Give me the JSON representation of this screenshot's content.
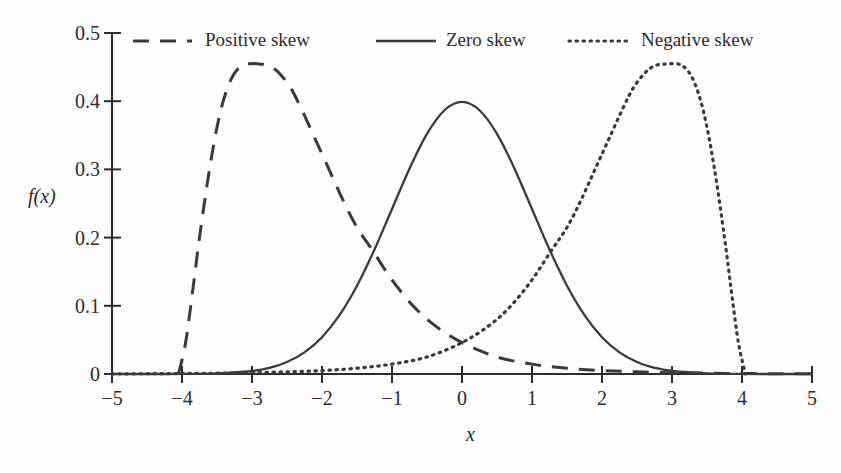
{
  "chart_data": {
    "type": "line",
    "title": "",
    "subtitle": "",
    "xlabel": "x",
    "ylabel": "f(x)",
    "xlim": [
      -5,
      5
    ],
    "ylim": [
      0,
      0.5
    ],
    "grid": false,
    "legend_position": "top-inside",
    "x_ticks": [
      "−5",
      "−4",
      "−3",
      "−2",
      "−1",
      "0",
      "1",
      "2",
      "3",
      "4",
      "5"
    ],
    "x_tick_values": [
      -5,
      -4,
      -3,
      -2,
      -1,
      0,
      1,
      2,
      3,
      4,
      5
    ],
    "y_ticks": [
      "0",
      "0.1",
      "0.2",
      "0.3",
      "0.4",
      "0.5"
    ],
    "y_tick_values": [
      0,
      0.1,
      0.2,
      0.3,
      0.4,
      0.5
    ],
    "line_color": "#3a3a3a",
    "axis_color": "#2b2b2b",
    "series": [
      {
        "name": "Positive skew",
        "style": "dashed",
        "peak_x": -2.8,
        "peak_y": 0.455,
        "x": [
          -4.05,
          -3.95,
          -3.85,
          -3.75,
          -3.6,
          -3.45,
          -3.3,
          -3.15,
          -3.0,
          -2.9,
          -2.8,
          -2.7,
          -2.6,
          -2.45,
          -2.3,
          -2.1,
          -1.9,
          -1.7,
          -1.5,
          -1.27,
          -1.0,
          -0.7,
          -0.4,
          0.0,
          0.5,
          1.0,
          1.5,
          2.0,
          2.5,
          3.0,
          3.5,
          4.0,
          4.5,
          5.0
        ],
        "values": [
          0.0,
          0.045,
          0.12,
          0.2,
          0.305,
          0.385,
          0.432,
          0.452,
          0.455,
          0.4545,
          0.4535,
          0.449,
          0.44,
          0.42,
          0.39,
          0.345,
          0.3,
          0.255,
          0.215,
          0.18,
          0.138,
          0.1,
          0.072,
          0.046,
          0.025,
          0.0145,
          0.0085,
          0.005,
          0.0032,
          0.002,
          0.0012,
          0.0007,
          0.0004,
          0.0002
        ]
      },
      {
        "name": "Zero skew",
        "style": "solid",
        "peak_x": 0.0,
        "peak_y": 0.399,
        "x": [
          -5.0,
          -4.5,
          -4.0,
          -3.5,
          -3.0,
          -2.75,
          -2.5,
          -2.25,
          -2.0,
          -1.75,
          -1.5,
          -1.25,
          -1.0,
          -0.75,
          -0.5,
          -0.25,
          0.0,
          0.25,
          0.5,
          0.75,
          1.0,
          1.25,
          1.5,
          1.75,
          2.0,
          2.25,
          2.5,
          2.75,
          3.0,
          3.5,
          4.0,
          4.5,
          5.0
        ],
        "values": [
          1.5e-06,
          1.6e-05,
          0.00013,
          0.0009,
          0.0044,
          0.0091,
          0.0175,
          0.0317,
          0.054,
          0.0863,
          0.1295,
          0.1826,
          0.242,
          0.3011,
          0.3521,
          0.3867,
          0.3989,
          0.3867,
          0.3521,
          0.3011,
          0.242,
          0.1826,
          0.1295,
          0.0863,
          0.054,
          0.0317,
          0.0175,
          0.0091,
          0.0044,
          0.0009,
          0.00013,
          1.6e-05,
          1.5e-06
        ]
      },
      {
        "name": "Negative skew",
        "style": "dotted",
        "peak_x": 2.8,
        "peak_y": 0.455,
        "x": [
          -5.0,
          -4.5,
          -4.0,
          -3.5,
          -3.0,
          -2.5,
          -2.0,
          -1.5,
          -1.0,
          -0.5,
          0.0,
          0.4,
          0.7,
          1.0,
          1.27,
          1.5,
          1.7,
          1.9,
          2.1,
          2.3,
          2.45,
          2.6,
          2.7,
          2.8,
          2.9,
          3.0,
          3.15,
          3.3,
          3.45,
          3.6,
          3.75,
          3.85,
          3.95,
          4.05
        ],
        "values": [
          0.0002,
          0.0004,
          0.0007,
          0.0012,
          0.002,
          0.0032,
          0.005,
          0.0085,
          0.0145,
          0.025,
          0.046,
          0.072,
          0.1,
          0.138,
          0.18,
          0.215,
          0.255,
          0.3,
          0.345,
          0.39,
          0.42,
          0.44,
          0.449,
          0.4535,
          0.4545,
          0.455,
          0.452,
          0.432,
          0.385,
          0.305,
          0.2,
          0.12,
          0.045,
          0.0
        ]
      }
    ]
  },
  "legend": {
    "entries": [
      {
        "label": "Positive skew",
        "style": "dashed"
      },
      {
        "label": "Zero skew",
        "style": "solid"
      },
      {
        "label": "Negative skew",
        "style": "dotted"
      }
    ]
  },
  "axes": {
    "x_title": "x",
    "y_title": "f(x)"
  }
}
